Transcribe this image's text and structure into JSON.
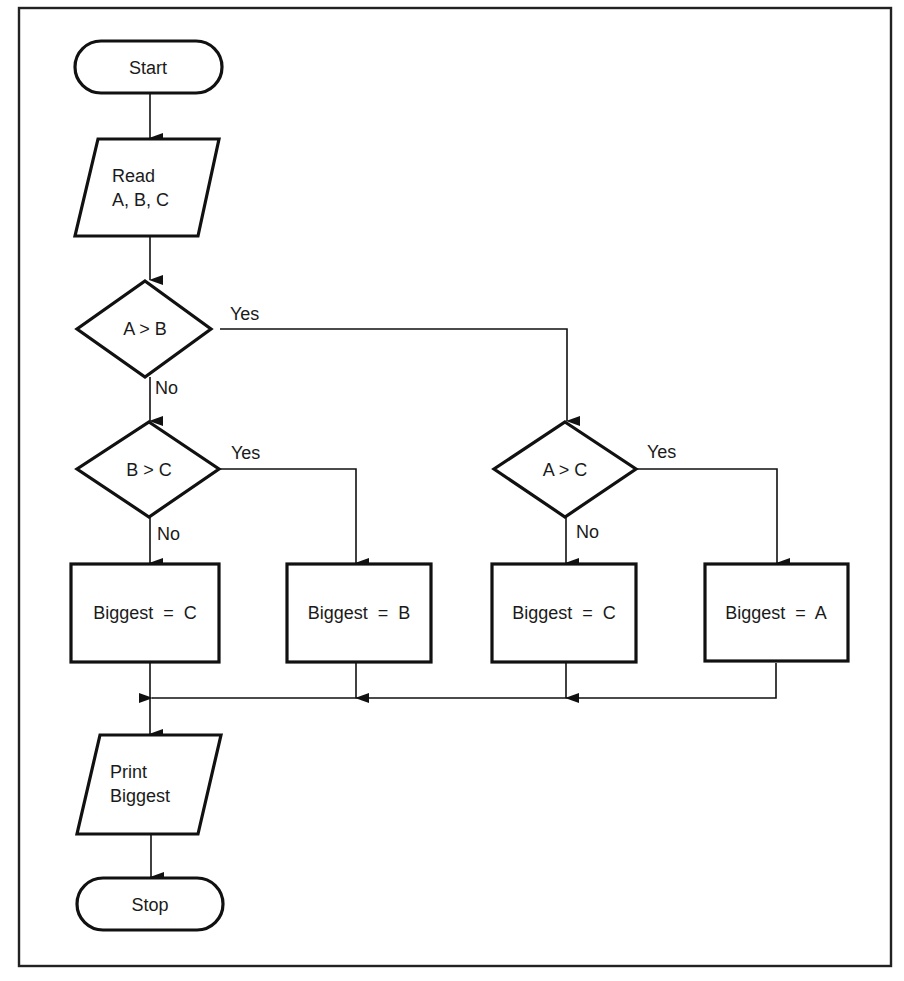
{
  "diagram": {
    "type": "flowchart",
    "nodes": {
      "start": {
        "shape": "terminator",
        "label": "Start"
      },
      "read": {
        "shape": "input-output",
        "line1": "Read",
        "line2": "A, B, C"
      },
      "dec_ab": {
        "shape": "decision",
        "label": "A > B",
        "yes": "Yes",
        "no": "No"
      },
      "dec_bc": {
        "shape": "decision",
        "label": "B > C",
        "yes": "Yes",
        "no": "No"
      },
      "dec_ac": {
        "shape": "decision",
        "label": "A > C",
        "yes": "Yes",
        "no": "No"
      },
      "proc_c1": {
        "shape": "process",
        "label": "Biggest  =  C"
      },
      "proc_b": {
        "shape": "process",
        "label": "Biggest  =  B"
      },
      "proc_c2": {
        "shape": "process",
        "label": "Biggest  =  C"
      },
      "proc_a": {
        "shape": "process",
        "label": "Biggest  =  A"
      },
      "print": {
        "shape": "input-output",
        "line1": "Print",
        "line2": "Biggest"
      },
      "stop": {
        "shape": "terminator",
        "label": "Stop"
      }
    },
    "edges": [
      {
        "from": "start",
        "to": "read",
        "label": ""
      },
      {
        "from": "read",
        "to": "dec_ab",
        "label": ""
      },
      {
        "from": "dec_ab",
        "to": "dec_ac",
        "label": "Yes"
      },
      {
        "from": "dec_ab",
        "to": "dec_bc",
        "label": "No"
      },
      {
        "from": "dec_bc",
        "to": "proc_b",
        "label": "Yes"
      },
      {
        "from": "dec_bc",
        "to": "proc_c1",
        "label": "No"
      },
      {
        "from": "dec_ac",
        "to": "proc_a",
        "label": "Yes"
      },
      {
        "from": "dec_ac",
        "to": "proc_c2",
        "label": "No"
      },
      {
        "from": "proc_c1",
        "to": "print",
        "label": ""
      },
      {
        "from": "proc_b",
        "to": "print",
        "label": ""
      },
      {
        "from": "proc_c2",
        "to": "print",
        "label": ""
      },
      {
        "from": "proc_a",
        "to": "print",
        "label": ""
      },
      {
        "from": "print",
        "to": "stop",
        "label": ""
      }
    ],
    "colors": {
      "stroke": "#111111",
      "background": "#ffffff",
      "text": "#1a1a1a"
    }
  }
}
